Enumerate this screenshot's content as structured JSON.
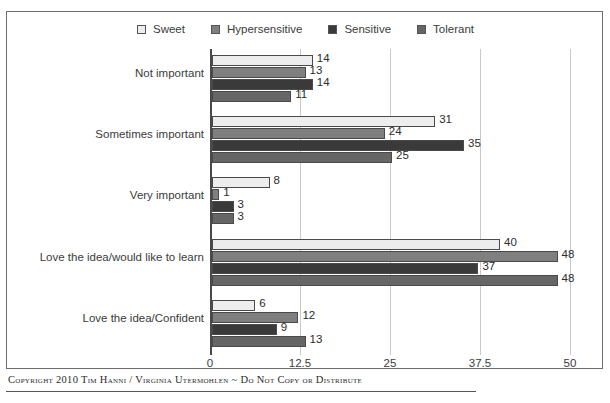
{
  "scan_artifact_text": "·· ··· · ·· · ··· · ·· ··· · ·",
  "footer": {
    "text": "Copyright 2010  Tim Hanni / Virginia Utermohlen ~ Do Not Copy or Distribute"
  },
  "colors": {
    "sweet": "#ededed",
    "hypersensitive": "#7f7f7f",
    "sensitive": "#3a3a3a",
    "tolerant": "#666666",
    "axis": "#4a4a4a",
    "grid": "#c9c9c9",
    "frame": "#6e6e6e"
  },
  "chart_data": {
    "type": "bar",
    "orientation": "horizontal",
    "title": "",
    "subtitle": "",
    "xlabel": "",
    "ylabel": "",
    "xlim": [
      0,
      50
    ],
    "xticks": [
      0,
      12.5,
      25,
      37.5,
      50
    ],
    "xtick_labels": [
      "0",
      "12.5",
      "25",
      "37.5",
      "50"
    ],
    "grid": true,
    "grid_axis": "x",
    "legend_position": "top-center",
    "categories": [
      "Not important",
      "Sometimes important",
      "Very important",
      "Love the idea/would like to learn",
      "Love the idea/Confident"
    ],
    "series": [
      {
        "name": "Sweet",
        "color": "#ededed",
        "values": [
          14,
          31,
          8,
          40,
          6
        ]
      },
      {
        "name": "Hypersensitive",
        "color": "#7f7f7f",
        "values": [
          13,
          24,
          1,
          48,
          12
        ]
      },
      {
        "name": "Sensitive",
        "color": "#3a3a3a",
        "values": [
          14,
          35,
          3,
          37,
          9
        ]
      },
      {
        "name": "Tolerant",
        "color": "#666666",
        "values": [
          11,
          25,
          3,
          48,
          13
        ]
      }
    ],
    "data_labels": true
  }
}
